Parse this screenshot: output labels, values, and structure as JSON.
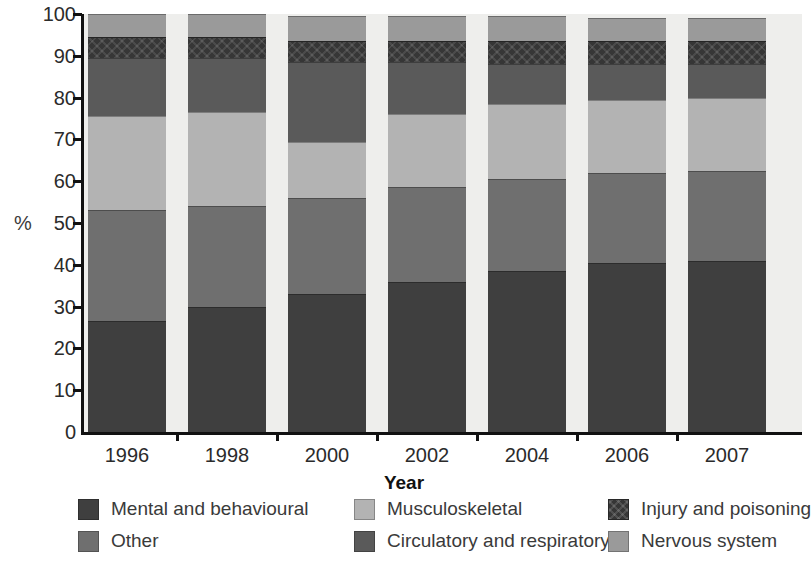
{
  "chart_data": {
    "type": "bar",
    "subtype": "stacked-100-percent",
    "title": "",
    "xlabel": "Year",
    "ylabel": "%",
    "ylim": [
      0,
      100
    ],
    "yticks": [
      0,
      10,
      20,
      30,
      40,
      50,
      60,
      70,
      80,
      90,
      100
    ],
    "grid": false,
    "legend_position": "bottom",
    "legend_columns": 3,
    "categories": [
      "1996",
      "1998",
      "2000",
      "2002",
      "2004",
      "2006",
      "2007"
    ],
    "series": [
      {
        "name": "Mental and behavioural",
        "color": "#3f3f3f",
        "hatch": false,
        "values": [
          26.5,
          30.0,
          33.0,
          36.0,
          38.5,
          40.5,
          41.0
        ]
      },
      {
        "name": "Other",
        "color": "#6f6f6f",
        "hatch": false,
        "values": [
          26.5,
          24.0,
          23.0,
          22.5,
          22.0,
          21.5,
          21.5
        ]
      },
      {
        "name": "Musculoskeletal",
        "color": "#b3b3b3",
        "hatch": false,
        "values": [
          22.5,
          22.5,
          13.5,
          17.5,
          18.0,
          17.5,
          17.5
        ]
      },
      {
        "name": "Circulatory and respiratory",
        "color": "#5a5a5a",
        "hatch": false,
        "values": [
          14.0,
          13.0,
          19.0,
          12.5,
          9.5,
          8.5,
          8.0
        ]
      },
      {
        "name": "Injury and poisoning",
        "color": "#363636",
        "hatch": true,
        "values": [
          5.0,
          5.0,
          5.0,
          5.0,
          5.5,
          5.5,
          5.5
        ]
      },
      {
        "name": "Nervous system",
        "color": "#9a9a9a",
        "hatch": false,
        "values": [
          5.5,
          5.5,
          6.0,
          6.0,
          6.0,
          5.5,
          5.5
        ]
      }
    ],
    "stack_tops": {
      "1996": [
        26.5,
        53.0,
        75.5,
        89.5,
        94.5,
        100.0
      ],
      "1998": [
        30.0,
        54.0,
        76.5,
        89.5,
        94.5,
        100.0
      ],
      "2000": [
        33.0,
        56.0,
        69.5,
        88.5,
        93.5,
        99.5
      ],
      "2002": [
        36.0,
        58.5,
        76.0,
        88.5,
        93.5,
        99.5
      ],
      "2004": [
        38.5,
        60.5,
        78.5,
        88.0,
        93.5,
        99.5
      ],
      "2006": [
        40.5,
        62.0,
        79.5,
        88.0,
        93.5,
        99.0
      ],
      "2007": [
        41.0,
        62.5,
        80.0,
        88.0,
        93.5,
        99.0
      ]
    }
  },
  "legend": {
    "items": [
      {
        "label": "Mental and behavioural",
        "color": "#3f3f3f",
        "hatch": false
      },
      {
        "label": "Musculoskeletal",
        "color": "#b3b3b3",
        "hatch": false
      },
      {
        "label": "Injury and poisoning",
        "color": "#363636",
        "hatch": true
      },
      {
        "label": "Other",
        "color": "#6f6f6f",
        "hatch": false
      },
      {
        "label": "Circulatory and respiratory",
        "color": "#5a5a5a",
        "hatch": false
      },
      {
        "label": "Nervous system",
        "color": "#9a9a9a",
        "hatch": false
      }
    ]
  },
  "colors": {
    "plot_background": "#eeeeec",
    "axis": "#111111",
    "page_background": "#ffffff"
  }
}
